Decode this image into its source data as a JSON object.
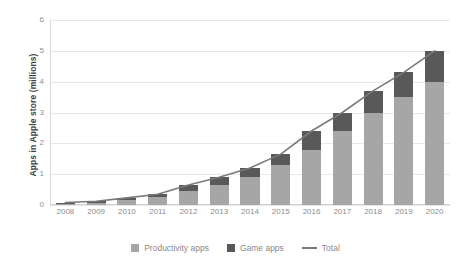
{
  "chart_data": {
    "type": "bar",
    "stacked": true,
    "title": "",
    "xlabel": "",
    "ylabel": "Apps in Apple store (millions)",
    "categories": [
      "2008",
      "2009",
      "2010",
      "2011",
      "2012",
      "2013",
      "2014",
      "2015",
      "2016",
      "2017",
      "2018",
      "2019",
      "2020"
    ],
    "series": [
      {
        "name": "Productivity apps",
        "type": "bar",
        "color": "#a6a6a6",
        "values": [
          0.05,
          0.08,
          0.15,
          0.25,
          0.45,
          0.65,
          0.9,
          1.3,
          1.8,
          2.4,
          3.0,
          3.5,
          4.0
        ]
      },
      {
        "name": "Game apps",
        "type": "bar",
        "color": "#595959",
        "values": [
          0.03,
          0.04,
          0.08,
          0.1,
          0.2,
          0.25,
          0.3,
          0.35,
          0.6,
          0.6,
          0.7,
          0.8,
          1.0
        ]
      },
      {
        "name": "Total",
        "type": "line",
        "color": "#7a7a7a",
        "values": [
          0.08,
          0.12,
          0.23,
          0.35,
          0.65,
          0.9,
          1.2,
          1.65,
          2.4,
          3.0,
          3.7,
          4.3,
          5.0
        ]
      }
    ],
    "yticks": [
      0,
      1,
      2,
      3,
      4,
      5,
      6
    ],
    "ylim": [
      0,
      6
    ],
    "grid": true,
    "legend_position": "bottom"
  },
  "legend": {
    "items": [
      {
        "label": "Productivity apps",
        "marker": "square",
        "color": "#a6a6a6"
      },
      {
        "label": "Game apps",
        "marker": "square",
        "color": "#595959"
      },
      {
        "label": "Total",
        "marker": "line",
        "color": "#7a7a7a"
      }
    ]
  }
}
